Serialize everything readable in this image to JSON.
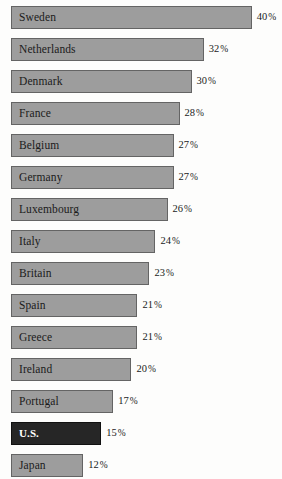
{
  "chart_data": {
    "type": "bar",
    "orientation": "horizontal",
    "title": "",
    "subtitle": "",
    "xlabel": "",
    "ylabel": "",
    "xlim": [
      0,
      40
    ],
    "grid": false,
    "legend": null,
    "value_suffix": "%",
    "categories": [
      "Sweden",
      "Netherlands",
      "Denmark",
      "France",
      "Belgium",
      "Germany",
      "Luxembourg",
      "Italy",
      "Britain",
      "Spain",
      "Greece",
      "Ireland",
      "Portugal",
      "U.S.",
      "Japan"
    ],
    "values": [
      40,
      32,
      30,
      28,
      27,
      27,
      26,
      24,
      23,
      21,
      21,
      20,
      17,
      15,
      12
    ],
    "value_labels": [
      "40%",
      "32%",
      "30%",
      "28%",
      "27%",
      "27%",
      "26%",
      "24%",
      "23%",
      "21%",
      "21%",
      "20%",
      "17%",
      "15%",
      "12%"
    ],
    "highlight_category": "U.S.",
    "colors": {
      "background": "#fdfdfc",
      "bar_fill": "#9d9d9d",
      "bar_border": "#646464",
      "highlight_fill": "#262626",
      "highlight_border": "#111111",
      "label_text": "#1b1b1b",
      "highlight_label_text": "#ffffff"
    }
  },
  "rows": [
    {
      "label": "Sweden",
      "value": 40,
      "value_label": "40",
      "pct": "%",
      "highlight": false
    },
    {
      "label": "Netherlands",
      "value": 32,
      "value_label": "32",
      "pct": "%",
      "highlight": false
    },
    {
      "label": "Denmark",
      "value": 30,
      "value_label": "30",
      "pct": "%",
      "highlight": false
    },
    {
      "label": "France",
      "value": 28,
      "value_label": "28",
      "pct": "%",
      "highlight": false
    },
    {
      "label": "Belgium",
      "value": 27,
      "value_label": "27",
      "pct": "%",
      "highlight": false
    },
    {
      "label": "Germany",
      "value": 27,
      "value_label": "27",
      "pct": "%",
      "highlight": false
    },
    {
      "label": "Luxembourg",
      "value": 26,
      "value_label": "26",
      "pct": "%",
      "highlight": false
    },
    {
      "label": "Italy",
      "value": 24,
      "value_label": "24",
      "pct": "%",
      "highlight": false
    },
    {
      "label": "Britain",
      "value": 23,
      "value_label": "23",
      "pct": "%",
      "highlight": false
    },
    {
      "label": "Spain",
      "value": 21,
      "value_label": "21",
      "pct": "%",
      "highlight": false
    },
    {
      "label": "Greece",
      "value": 21,
      "value_label": "21",
      "pct": "%",
      "highlight": false
    },
    {
      "label": "Ireland",
      "value": 20,
      "value_label": "20",
      "pct": "%",
      "highlight": false
    },
    {
      "label": "Portugal",
      "value": 17,
      "value_label": "17",
      "pct": "%",
      "highlight": false
    },
    {
      "label": "U.S.",
      "value": 15,
      "value_label": "15",
      "pct": "%",
      "highlight": true
    },
    {
      "label": "Japan",
      "value": 12,
      "value_label": "12",
      "pct": "%",
      "highlight": false
    }
  ],
  "scale": {
    "px_per_unit": 6.02,
    "bar_origin_x": 11
  }
}
